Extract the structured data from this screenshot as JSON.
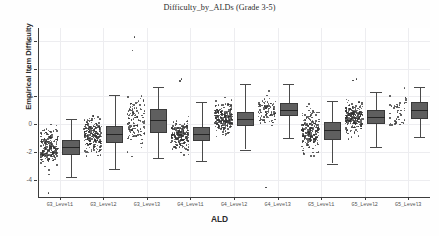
{
  "chart_data": {
    "type": "box",
    "title": "Difficulty_by_ALDs (Grade 3-5)",
    "xlabel": "ALD",
    "ylabel": "Empirical Item Difficulty",
    "grid": true,
    "legend": "none",
    "ylim": [
      -5.2,
      6.9
    ],
    "yticks": [
      6,
      4,
      2,
      0,
      -2,
      -4
    ],
    "ytick_labels": [
      "6",
      "4",
      "2",
      "0",
      "-2",
      "-4"
    ],
    "categories": [
      "G3_Level1",
      "G3_Level2",
      "G3_Level3",
      "G4_Level1",
      "G4_Level2",
      "G4_Level3",
      "G5_Level1",
      "G5_Level2",
      "G5_Level3"
    ],
    "boxes": [
      {
        "category": "G3_Level1",
        "q1": -2.2,
        "median": -1.6,
        "q3": -1.1,
        "whisker_low": -3.8,
        "whisker_high": 0.4,
        "n": 210,
        "fliers": [
          -4.85
        ]
      },
      {
        "category": "G3_Level2",
        "q1": -1.3,
        "median": -0.7,
        "q3": -0.1,
        "whisker_low": -3.2,
        "whisker_high": 2.1,
        "n": 230,
        "fliers": []
      },
      {
        "category": "G3_Level3",
        "q1": -0.6,
        "median": 0.3,
        "q3": 1.1,
        "whisker_low": -2.4,
        "whisker_high": 2.7,
        "n": 120,
        "fliers": [
          6.3,
          5.35
        ]
      },
      {
        "category": "G4_Level1",
        "q1": -1.2,
        "median": -0.7,
        "q3": -0.2,
        "whisker_low": -2.6,
        "whisker_high": 1.6,
        "n": 200,
        "fliers": [
          3.3,
          3.15
        ]
      },
      {
        "category": "G4_Level2",
        "q1": -0.1,
        "median": 0.4,
        "q3": 0.9,
        "whisker_low": -1.8,
        "whisker_high": 2.9,
        "n": 230,
        "fliers": []
      },
      {
        "category": "G4_Level3",
        "q1": 0.6,
        "median": 1.0,
        "q3": 1.5,
        "whisker_low": -1.0,
        "whisker_high": 2.9,
        "n": 95,
        "fliers": [
          -4.45
        ]
      },
      {
        "category": "G5_Level1",
        "q1": -1.1,
        "median": -0.4,
        "q3": 0.2,
        "whisker_low": -2.8,
        "whisker_high": 1.7,
        "n": 215,
        "fliers": []
      },
      {
        "category": "G5_Level2",
        "q1": 0.0,
        "median": 0.5,
        "q3": 1.0,
        "whisker_low": -1.6,
        "whisker_high": 2.3,
        "n": 240,
        "fliers": [
          3.3,
          3.2
        ]
      },
      {
        "category": "G5_Level3",
        "q1": 0.4,
        "median": 1.0,
        "q3": 1.6,
        "whisker_low": -0.9,
        "whisker_high": 2.7,
        "n": 45,
        "fliers": []
      }
    ],
    "series_note": "Each category shows a jittered strip of individual item points to the left of its box."
  },
  "colors": {
    "box_fill": "#5f5f5f",
    "box_edge": "#3a3a3a",
    "median": "#252525",
    "point": "#313131",
    "grid": "#ededf0",
    "axis": "#3d3d3d",
    "background": "#ffffff"
  }
}
